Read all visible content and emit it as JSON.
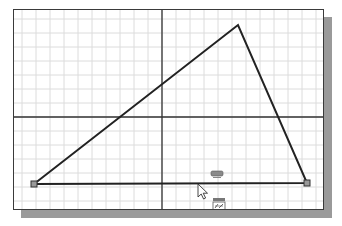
{
  "canvas": {
    "background": "#ffffff",
    "border_color": "#3a3a3a",
    "shadow_color": "#9a9a9a",
    "grid_color": "#dcdcdc",
    "grid_spacing": 14,
    "axis_color": "#333333"
  },
  "axes": {
    "vertical_x": 148,
    "horizontal_y": 107
  },
  "triangle": {
    "stroke": "#222222",
    "vertices": {
      "apex": [
        224,
        15
      ],
      "left": [
        20,
        174
      ],
      "right": [
        293,
        173
      ]
    },
    "endpoint_markers": [
      "left",
      "right"
    ]
  },
  "cursor": {
    "icon": "arrow-pointer-icon",
    "position": [
      184,
      174
    ]
  },
  "snap_indicators": [
    {
      "icon": "parallel-snap-icon",
      "position": [
        197,
        161
      ]
    },
    {
      "icon": "dimension-snap-icon",
      "position": [
        199,
        188
      ]
    }
  ]
}
